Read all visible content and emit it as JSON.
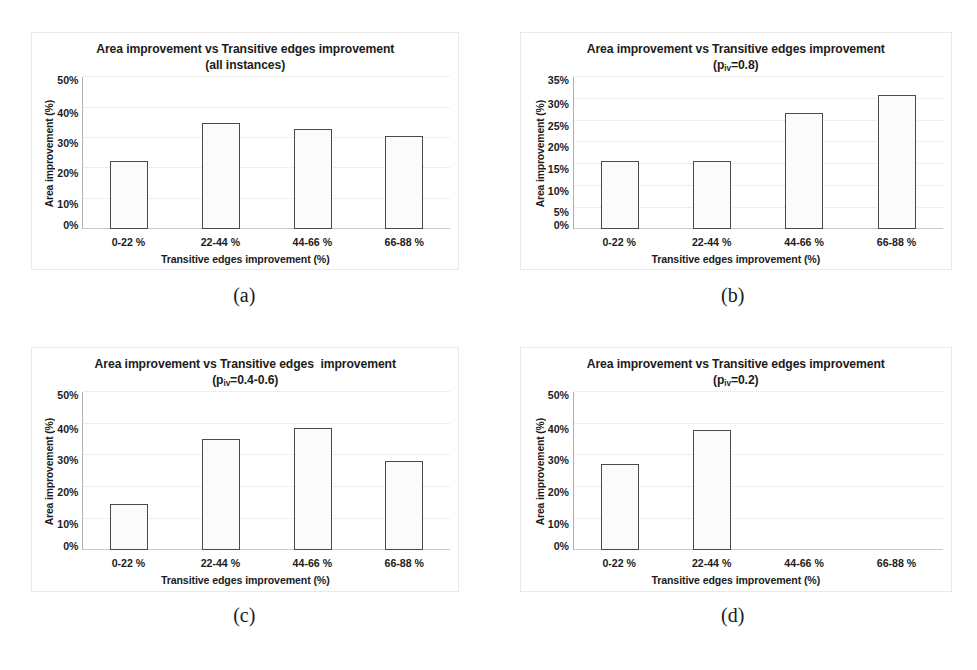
{
  "figure": {
    "axis_labels": {
      "x_title": "Transitive edges improvement (%)",
      "y_title": "Area improvement (%)"
    },
    "categories": [
      "0-22 %",
      "22-44 %",
      "44-66 %",
      "66-88 %"
    ],
    "subfigures": [
      {
        "caption": "(a)",
        "title_line1": "Area improvement vs Transitive edges improvement",
        "subtitle_prefix": "(all instances)",
        "subtitle_sub": "",
        "subtitle_suffix": ""
      },
      {
        "caption": "(b)",
        "title_line1": "Area improvement vs Transitive edges improvement",
        "subtitle_prefix": "(p",
        "subtitle_sub": "iv",
        "subtitle_suffix": "=0.8)"
      },
      {
        "caption": "(c)",
        "title_line1": "Area improvement vs Transitive edges  improvement",
        "subtitle_prefix": "(p",
        "subtitle_sub": "iv",
        "subtitle_suffix": "=0.4-0.6)"
      },
      {
        "caption": "(d)",
        "title_line1": "Area improvement vs Transitive edges improvement",
        "subtitle_prefix": "(p",
        "subtitle_sub": "iv",
        "subtitle_suffix": "=0.2)"
      }
    ]
  },
  "chart_data": [
    {
      "type": "bar",
      "panel": "a",
      "title": "Area improvement vs Transitive edges improvement (all instances)",
      "xlabel": "Transitive edges improvement (%)",
      "ylabel": "Area improvement (%)",
      "categories": [
        "0-22 %",
        "22-44 %",
        "44-66 %",
        "66-88 %"
      ],
      "values": [
        22.5,
        35.1,
        33.0,
        30.6
      ],
      "ylim": [
        0,
        50
      ],
      "yticks": [
        "0%",
        "10%",
        "20%",
        "30%",
        "40%",
        "50%"
      ],
      "ytick_values": [
        0,
        10,
        20,
        30,
        40,
        50
      ],
      "grid": true,
      "legend": "none"
    },
    {
      "type": "bar",
      "panel": "b",
      "title": "Area improvement vs Transitive edges improvement (p_iv=0.8)",
      "xlabel": "Transitive edges improvement (%)",
      "ylabel": "Area improvement (%)",
      "categories": [
        "0-22 %",
        "22-44 %",
        "44-66 %",
        "66-88 %"
      ],
      "values": [
        15.8,
        15.8,
        26.8,
        31.0
      ],
      "ylim": [
        0,
        35
      ],
      "yticks": [
        "0%",
        "5%",
        "10%",
        "15%",
        "20%",
        "25%",
        "30%",
        "35%"
      ],
      "ytick_values": [
        0,
        5,
        10,
        15,
        20,
        25,
        30,
        35
      ],
      "grid": true,
      "legend": "none"
    },
    {
      "type": "bar",
      "panel": "c",
      "title": "Area improvement vs Transitive edges  improvement (p_iv=0.4-0.6)",
      "xlabel": "Transitive edges improvement (%)",
      "ylabel": "Area improvement (%)",
      "categories": [
        "0-22 %",
        "22-44 %",
        "44-66 %",
        "66-88 %"
      ],
      "values": [
        14.7,
        35.2,
        38.7,
        28.3
      ],
      "ylim": [
        0,
        50
      ],
      "yticks": [
        "0%",
        "10%",
        "20%",
        "30%",
        "40%",
        "50%"
      ],
      "ytick_values": [
        0,
        10,
        20,
        30,
        40,
        50
      ],
      "grid": true,
      "legend": "none"
    },
    {
      "type": "bar",
      "panel": "d",
      "title": "Area improvement vs Transitive edges improvement (p_iv=0.2)",
      "xlabel": "Transitive edges improvement (%)",
      "ylabel": "Area improvement (%)",
      "categories": [
        "0-22 %",
        "22-44 %",
        "44-66 %",
        "66-88 %"
      ],
      "values": [
        27.3,
        38.0,
        0,
        0
      ],
      "ylim": [
        0,
        50
      ],
      "yticks": [
        "0%",
        "10%",
        "20%",
        "30%",
        "40%",
        "50%"
      ],
      "ytick_values": [
        0,
        10,
        20,
        30,
        40,
        50
      ],
      "grid": true,
      "legend": "none"
    }
  ]
}
